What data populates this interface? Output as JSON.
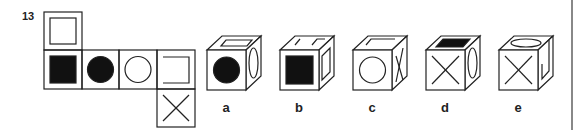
{
  "question": {
    "number": "13",
    "net": {
      "faces": [
        {
          "position": "top",
          "symbol": "open-square-outline"
        },
        {
          "position": "row-1",
          "symbol": "filled-square"
        },
        {
          "position": "row-2",
          "symbol": "filled-circle"
        },
        {
          "position": "row-3",
          "symbol": "open-circle"
        },
        {
          "position": "row-4",
          "symbol": "bracket-open-left"
        },
        {
          "position": "bottom",
          "symbol": "x-cross"
        }
      ]
    },
    "options": [
      {
        "label": "a",
        "front": "filled-circle",
        "top": "square-outline",
        "side": "ellipse"
      },
      {
        "label": "b",
        "front": "filled-square",
        "top": "bracket",
        "side": "square-outline"
      },
      {
        "label": "c",
        "front": "open-circle",
        "top": "bracket",
        "side": "x-cross"
      },
      {
        "label": "d",
        "front": "x-cross",
        "top": "filled-square",
        "side": "ellipse"
      },
      {
        "label": "e",
        "front": "x-cross",
        "top": "ellipse",
        "side": "bracket"
      }
    ]
  }
}
